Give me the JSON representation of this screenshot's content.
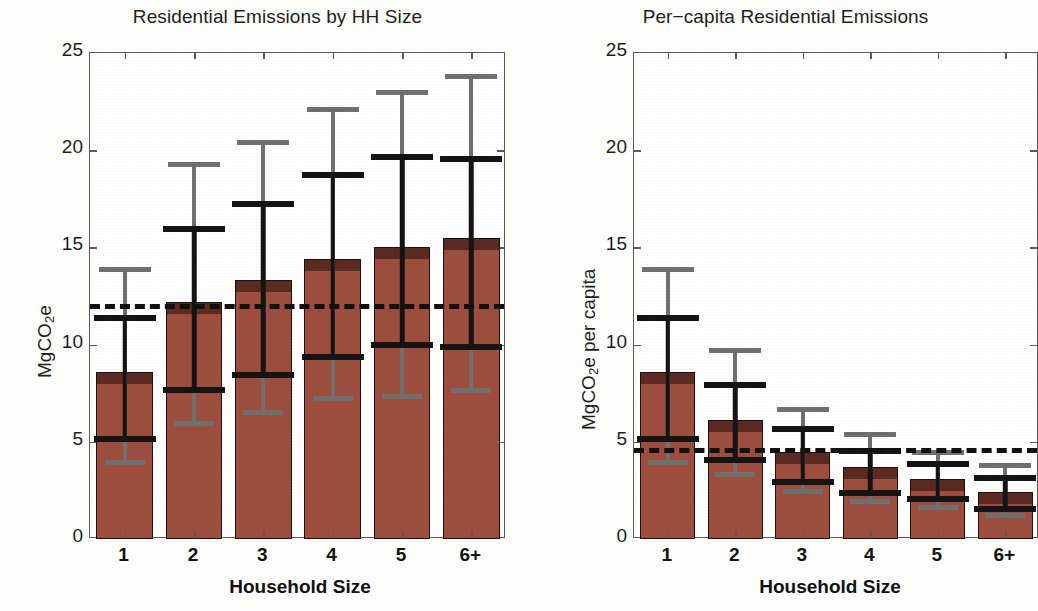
{
  "figure": {
    "panels": [
      {
        "id": "left",
        "title": "Residential Emissions by HH Size",
        "ylabel_pre": "MgCO",
        "ylabel_sub": "2",
        "ylabel_post": "e",
        "xlabel": "Household Size"
      },
      {
        "id": "right",
        "title": "Per−capita Residential Emissions",
        "ylabel_pre": "MgCO",
        "ylabel_sub": "2",
        "ylabel_post": "e per capita",
        "xlabel": "Household Size"
      }
    ],
    "colors": {
      "bar_fill": "#9d4d3e",
      "bar_cap": "#5b2b22",
      "bar_edge": "#1a1010",
      "inner_error": "#141414",
      "outer_error": "#6f6f6f",
      "reference_line": "#111111",
      "axis": "#5a5a5a"
    }
  },
  "chart_data": [
    {
      "type": "bar",
      "title": "Residential Emissions by HH Size",
      "xlabel": "Household Size",
      "ylabel": "MgCO2e",
      "categories": [
        "1",
        "2",
        "3",
        "4",
        "5",
        "6+"
      ],
      "values": [
        8.6,
        12.2,
        13.3,
        14.4,
        15.0,
        15.5
      ],
      "ylim": [
        0,
        25
      ],
      "yticks": [
        0,
        5,
        10,
        15,
        20,
        25
      ],
      "grid": false,
      "legend": "none",
      "reference_line": {
        "value": 12.1,
        "style": "dashed",
        "label": ""
      },
      "error_inner": [
        {
          "low": 5.0,
          "high": 11.5
        },
        {
          "low": 7.5,
          "high": 16.1
        },
        {
          "low": 8.3,
          "high": 17.4
        },
        {
          "low": 9.2,
          "high": 18.9
        },
        {
          "low": 9.8,
          "high": 19.8
        },
        {
          "low": 9.7,
          "high": 19.7
        }
      ],
      "error_outer": [
        {
          "low": 3.8,
          "high": 14.0
        },
        {
          "low": 5.8,
          "high": 19.4
        },
        {
          "low": 6.4,
          "high": 20.5
        },
        {
          "low": 7.1,
          "high": 22.2
        },
        {
          "low": 7.2,
          "high": 23.1
        },
        {
          "low": 7.5,
          "high": 23.9
        }
      ]
    },
    {
      "type": "bar",
      "title": "Per-capita Residential Emissions",
      "xlabel": "Household Size",
      "ylabel": "MgCO2e per capita",
      "categories": [
        "1",
        "2",
        "3",
        "4",
        "5",
        "6+"
      ],
      "values": [
        8.6,
        6.1,
        4.5,
        3.7,
        3.1,
        2.4
      ],
      "ylim": [
        0,
        25
      ],
      "yticks": [
        0,
        5,
        10,
        15,
        20,
        25
      ],
      "grid": false,
      "legend": "none",
      "reference_line": {
        "value": 4.7,
        "style": "dashed",
        "label": ""
      },
      "error_inner": [
        {
          "low": 5.0,
          "high": 11.5
        },
        {
          "low": 3.9,
          "high": 8.1
        },
        {
          "low": 2.8,
          "high": 5.8
        },
        {
          "low": 2.2,
          "high": 4.7
        },
        {
          "low": 1.9,
          "high": 4.0
        },
        {
          "low": 1.4,
          "high": 3.3
        }
      ],
      "error_outer": [
        {
          "low": 3.8,
          "high": 14.0
        },
        {
          "low": 3.2,
          "high": 9.8
        },
        {
          "low": 2.3,
          "high": 6.8
        },
        {
          "low": 1.8,
          "high": 5.5
        },
        {
          "low": 1.5,
          "high": 4.6
        },
        {
          "low": 1.1,
          "high": 3.9
        }
      ]
    }
  ]
}
